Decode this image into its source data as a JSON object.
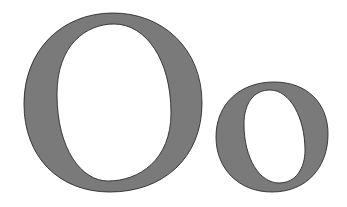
{
  "text": "Oo",
  "glyphs": [
    {
      "char": "O",
      "case": "uppercase"
    },
    {
      "char": "o",
      "case": "lowercase"
    }
  ],
  "colors": {
    "background": "#ffffff",
    "fill": "#7a7a7a",
    "outline": "#2b2b2b"
  }
}
